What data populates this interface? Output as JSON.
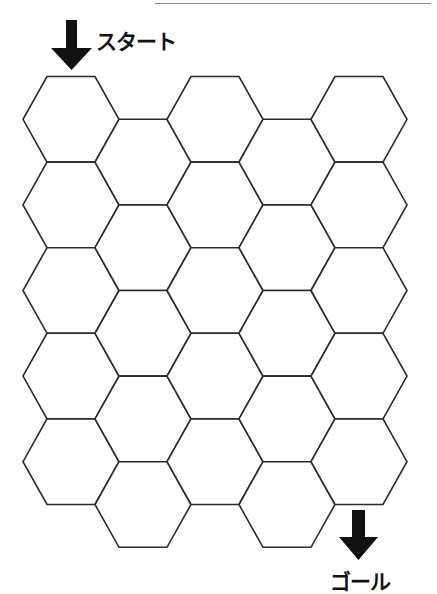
{
  "puzzle": {
    "start_label": "スタート",
    "goal_label": "ゴール",
    "grid": {
      "columns": 5,
      "rows_per_column": 5,
      "total_cells": 25,
      "orientation": "flat-top",
      "odd_columns_offset": "down half cell"
    },
    "start_cell": {
      "column": 0,
      "row": 0
    },
    "goal_cell": {
      "column": 4,
      "row": 4
    }
  },
  "colors": {
    "line": "#2a2a2a",
    "arrow": "#111111",
    "background": "#ffffff"
  },
  "icons": {
    "start_arrow": "arrow-down-icon",
    "goal_arrow": "arrow-down-icon"
  }
}
